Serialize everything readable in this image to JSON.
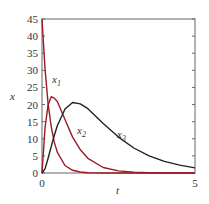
{
  "chart_data": {
    "type": "line",
    "title": "",
    "xlabel": "t",
    "ylabel": "x",
    "xlim": [
      0,
      5
    ],
    "ylim": [
      0,
      45
    ],
    "xticks": [
      0,
      5
    ],
    "yticks": [
      0,
      5,
      10,
      15,
      20,
      25,
      30,
      35,
      40,
      45
    ],
    "grid": false,
    "legend": "inline labels",
    "x": [
      0,
      0.1,
      0.2,
      0.3,
      0.4,
      0.5,
      0.75,
      1.0,
      1.25,
      1.5,
      2.0,
      2.5,
      3.0,
      3.5,
      4.0,
      4.5,
      5.0
    ],
    "series": [
      {
        "name": "x1",
        "color": "#9b1c24",
        "values": [
          45,
          30.2,
          20.2,
          13.6,
          9.1,
          6.1,
          2.2,
          0.8,
          0.3,
          0.1,
          0,
          0,
          0,
          0,
          0,
          0,
          0
        ]
      },
      {
        "name": "x2",
        "color": "#9b1c24",
        "values": [
          0,
          13.4,
          19.9,
          22.3,
          21.9,
          20.9,
          15.6,
          10.5,
          6.8,
          4.3,
          1.6,
          0.6,
          0.2,
          0.1,
          0,
          0,
          0
        ]
      },
      {
        "name": "x3",
        "color": "#222222",
        "values": [
          0,
          1.3,
          4.3,
          7.7,
          10.9,
          13.8,
          18.7,
          20.6,
          20.2,
          18.8,
          14.5,
          10.5,
          7.3,
          5.0,
          3.4,
          2.3,
          1.5
        ]
      }
    ],
    "annotations": [
      {
        "text": "x1",
        "t": 0.35,
        "x": 29
      },
      {
        "text": "x2",
        "t": 1.2,
        "x": 11
      },
      {
        "text": "x3",
        "t": 2.2,
        "x": 9
      }
    ]
  },
  "labels": {
    "xlabel": "t",
    "ylabel": "x",
    "x1": "x",
    "x2": "x",
    "x3": "x",
    "s1": "1",
    "s2": "2",
    "s3": "3"
  }
}
